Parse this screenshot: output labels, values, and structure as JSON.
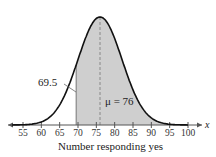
{
  "chart_data": {
    "type": "area",
    "title": "",
    "xlabel": "Number responding yes",
    "ylabel": "",
    "x_axis_symbol": "x",
    "xlim": [
      52,
      103
    ],
    "ticks": [
      "55",
      "60",
      "65",
      "70",
      "75",
      "80",
      "85",
      "90",
      "95",
      "100"
    ],
    "distribution": "normal",
    "mean": 76,
    "std_dev_estimate": 6,
    "shaded_region": {
      "from": 69.5,
      "to": "infinity"
    },
    "annotations": [
      {
        "text": "69.5",
        "x": 69.5,
        "role": "left boundary of shaded area"
      },
      {
        "text": "μ = 76",
        "x": 76,
        "role": "mean, dashed vertical line"
      }
    ],
    "grid": false,
    "legend": null,
    "colors": {
      "curve": "#111111",
      "shade": "#cfcfcf",
      "axis": "#555555"
    }
  },
  "labels": {
    "boundary": "69.5",
    "mean": "μ = 76",
    "xlabel": "Number responding yes",
    "x_symbol": "x"
  }
}
